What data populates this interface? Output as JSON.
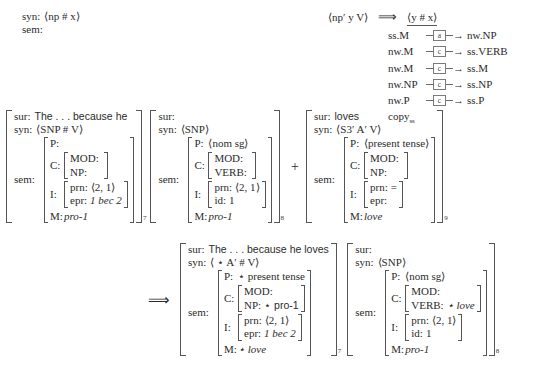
{
  "header_left": {
    "syn_label": "syn:",
    "syn_value": "⟨np # x⟩",
    "sem_label": "sem:"
  },
  "rewrite_rule": {
    "lhs": "⟨np′ y V⟩",
    "arrow": "⟹",
    "rhs": "⟨y # x⟩",
    "transfers": [
      {
        "source": "ss.M",
        "box": "a",
        "target": "nw.NP"
      },
      {
        "source": "nw.M",
        "box": "c",
        "target": "ss.VERB"
      },
      {
        "source": "nw.M",
        "box": "c",
        "target": "ss.M"
      },
      {
        "source": "nw.NP",
        "box": "c",
        "target": "ss.NP"
      },
      {
        "source": "nw.P",
        "box": "c",
        "target": "ss.P"
      }
    ],
    "copy_label": "copy",
    "copy_sub": "ss"
  },
  "row1": {
    "plus": "+",
    "matrix7": {
      "subscript": "7",
      "sur_label": "sur:",
      "sur_value": "The . . . because he",
      "syn_label": "syn:",
      "syn_value": "⟨SNP # V⟩",
      "sem_label": "sem:",
      "p_label": "P:",
      "p_value": "",
      "c_label": "C:",
      "c_rows": [
        {
          "key": "MOD:",
          "val": ""
        },
        {
          "key": "NP:",
          "val": ""
        }
      ],
      "i_label": "I:",
      "i_rows": [
        {
          "key": "prn:",
          "val": "⟨2, 1⟩",
          "italic": false
        },
        {
          "key": "epr:",
          "val": "1 bec 2",
          "italic": true
        }
      ],
      "m_label": "M:",
      "m_value": "pro-1"
    },
    "matrix8": {
      "subscript": "8",
      "sur_label": "sur:",
      "sur_value": "",
      "syn_label": "syn:",
      "syn_value": "⟨SNP⟩",
      "sem_label": "sem:",
      "p_label": "P:",
      "p_value": "⟨nom sg⟩",
      "c_label": "C:",
      "c_rows": [
        {
          "key": "MOD:",
          "val": ""
        },
        {
          "key": "VERB:",
          "val": ""
        }
      ],
      "i_label": "I:",
      "i_rows": [
        {
          "key": "prn:",
          "val": "⟨2, 1⟩",
          "italic": false
        },
        {
          "key": "id:",
          "val": "1",
          "italic": false
        }
      ],
      "m_label": "M:",
      "m_value": "pro-1"
    },
    "matrix9": {
      "subscript": "9",
      "sur_label": "sur:",
      "sur_value": "loves",
      "syn_label": "syn:",
      "syn_value": "⟨S3′ A′ V⟩",
      "sem_label": "sem:",
      "p_label": "P:",
      "p_value": "⟨present tense⟩",
      "c_label": "C:",
      "c_rows": [
        {
          "key": "MOD:",
          "val": ""
        },
        {
          "key": "NP:",
          "val": ""
        }
      ],
      "i_label": "I:",
      "i_rows": [
        {
          "key": "prn:",
          "val": "=",
          "italic": false
        },
        {
          "key": "epr:",
          "val": "",
          "italic": false
        }
      ],
      "m_label": "M:",
      "m_value": "love"
    }
  },
  "row2": {
    "implies": "⟹",
    "matrix7": {
      "subscript": "7",
      "sur_label": "sur:",
      "sur_value": "The . . . because he loves",
      "syn_label": "syn:",
      "syn_value": "⟨ ⋆ A′ # V⟩",
      "sem_label": "sem:",
      "p_label": "P:",
      "p_value": "⋆ present tense",
      "c_label": "C:",
      "c_rows": [
        {
          "key": "MOD:",
          "val": ""
        },
        {
          "key": "NP:",
          "val": "⋆ pro-1"
        }
      ],
      "i_label": "I:",
      "i_rows": [
        {
          "key": "prn:",
          "val": "⟨2, 1⟩",
          "italic": false
        },
        {
          "key": "epr:",
          "val": "1 bec 2",
          "italic": true
        }
      ],
      "m_label": "M:",
      "m_value": "⋆ love"
    },
    "matrix8": {
      "subscript": "8",
      "sur_label": "sur:",
      "sur_value": "",
      "syn_label": "syn:",
      "syn_value": "⟨SNP⟩",
      "sem_label": "sem:",
      "p_label": "P:",
      "p_value": "⟨nom sg⟩",
      "c_label": "C:",
      "c_rows": [
        {
          "key": "MOD:",
          "val": ""
        },
        {
          "key": "VERB:",
          "val": "⋆ love"
        }
      ],
      "i_label": "I:",
      "i_rows": [
        {
          "key": "prn:",
          "val": "⟨2, 1⟩",
          "italic": false
        },
        {
          "key": "id:",
          "val": "1",
          "italic": false
        }
      ],
      "m_label": "M:",
      "m_value": "pro-1"
    }
  }
}
